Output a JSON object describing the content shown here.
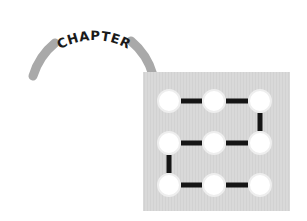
{
  "heading": {
    "label": "CHAPTER",
    "arc_color": "#a9a9a9",
    "text_color": "#1a1a1a"
  },
  "chapter_number": {
    "value": "2",
    "tile_color": "#d9d9d9",
    "dot_color": "#ffffff",
    "segment_color": "#151515",
    "grid_rows": 3,
    "grid_cols": 3
  }
}
